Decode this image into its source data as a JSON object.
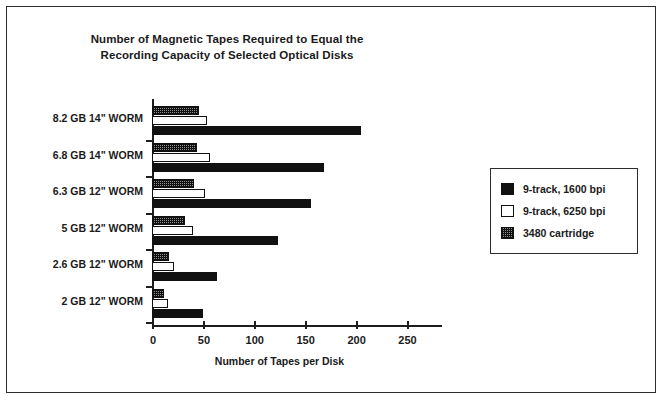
{
  "chart_data": {
    "type": "bar",
    "orientation": "horizontal",
    "title": "Number of Magnetic Tapes Required to Equal the Recording Capacity of Selected Optical Disks",
    "title_lines": [
      "Number of Magnetic Tapes Required to Equal the",
      "Recording Capacity of Selected Optical Disks"
    ],
    "xlabel": "Number of Tapes per Disk",
    "ylabel": "",
    "xlim": [
      0,
      250
    ],
    "xticks": [
      0,
      50,
      100,
      150,
      200,
      250
    ],
    "xtick_labels": [
      "0",
      "50",
      "100",
      "150",
      "200",
      "250"
    ],
    "grid": false,
    "legend_position": "right",
    "categories": [
      "8.2 GB 14\" WORM",
      "6.8 GB 14\" WORM",
      "6.3 GB 12\" WORM",
      "5 GB 12\" WORM",
      "2.6 GB 12\" WORM",
      "2 GB 12\" WORM"
    ],
    "series": [
      {
        "name": "9-track, 1600 bpi",
        "swatch": "black",
        "color": "#111111",
        "values": [
          205,
          169,
          156,
          124,
          64,
          50
        ]
      },
      {
        "name": "9-track, 6250 bpi",
        "swatch": "white",
        "color": "#ffffff",
        "values": [
          54,
          57,
          52,
          40,
          22,
          16
        ]
      },
      {
        "name": "3480 cartridge",
        "swatch": "hatch",
        "color": "#8e8e8e",
        "values": [
          46,
          44,
          41,
          32,
          17,
          12
        ]
      }
    ]
  }
}
